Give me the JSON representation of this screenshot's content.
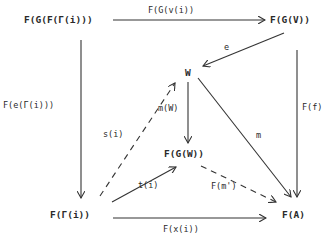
{
  "diagram": {
    "type": "commutative-diagram",
    "nodes": {
      "FGFri": "F(G(F(Γ(i)))",
      "FGV": "F(G(V))",
      "W": "W",
      "FGW": "F(G(W))",
      "Fri": "F(Γ(i))",
      "FA": "F(A)"
    },
    "edges": {
      "top": "F(G(v(i))",
      "e": "e",
      "left": "F(e(Γ(i)))",
      "right": "F(f)",
      "mW": "m(W)",
      "m": "m",
      "si": "s(i)",
      "ti": "t(i)",
      "Fm": "F(m')",
      "bottom": "F(x(i))"
    }
  }
}
